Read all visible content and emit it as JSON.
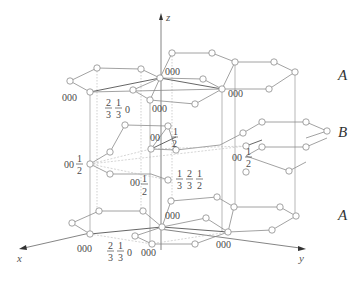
{
  "diagram": {
    "axes": {
      "x": "x",
      "y": "y",
      "z": "z"
    },
    "layers": [
      {
        "id": "top",
        "label": "A"
      },
      {
        "id": "middle",
        "label": "B"
      },
      {
        "id": "bottom",
        "label": "A"
      }
    ],
    "coordinate_labels": {
      "top_left_000": "000",
      "top_center_000": "000",
      "top_right_000": "000",
      "top_front_000": "000",
      "top_frac": {
        "n1": "2",
        "d1": "3",
        "n2": "1",
        "d2": "3",
        "z": "0"
      },
      "mid_center": {
        "prefix": "00",
        "num": "1",
        "den": "2"
      },
      "mid_left": {
        "prefix": "00",
        "num": "1",
        "den": "2"
      },
      "mid_right": {
        "prefix": "00",
        "num": "1",
        "den": "2"
      },
      "mid_front": {
        "prefix": "00",
        "num": "1",
        "den": "2"
      },
      "mid_frac": {
        "n1": "1",
        "d1": "3",
        "n2": "2",
        "d2": "3",
        "n3": "1",
        "d3": "2"
      },
      "bottom_left_000": "000",
      "bottom_center_000": "000",
      "bottom_right_000": "000",
      "bottom_front_000": "000",
      "bottom_frac": {
        "n1": "2",
        "d1": "3",
        "n2": "1",
        "d2": "3",
        "z": "0"
      }
    }
  }
}
